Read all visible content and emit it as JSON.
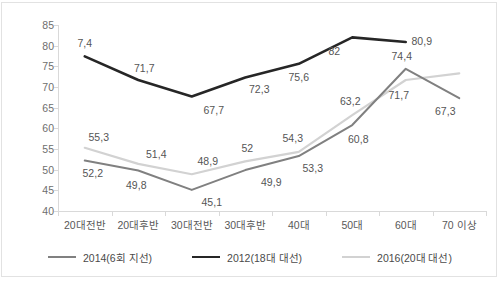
{
  "chart_data": {
    "type": "line",
    "title": "",
    "subtitle": "",
    "xlabel": "",
    "ylabel": "",
    "categories": [
      "20대전반",
      "20대후반",
      "30대전반",
      "30대후반",
      "40대",
      "50대",
      "60대",
      "70 이상"
    ],
    "ylim": [
      40,
      85
    ],
    "ytick_step": 5,
    "yticks": [
      "85",
      "80",
      "75",
      "70",
      "65",
      "60",
      "55",
      "50",
      "45",
      "40"
    ],
    "grid": false,
    "legend_position": "bottom",
    "series": [
      {
        "name": "2014(6회 지선)",
        "color": "#808080",
        "width": 2,
        "values": [
          52.2,
          49.8,
          45.1,
          49.9,
          53.3,
          60.8,
          74.4,
          67.3
        ],
        "labels": [
          "52,2",
          "49,8",
          "45,1",
          "49,9",
          "53,3",
          "60,8",
          "74,4",
          "67,3"
        ]
      },
      {
        "name": "2012(18대 대선)",
        "color": "#262626",
        "width": 2.6,
        "values": [
          77.4,
          71.7,
          67.7,
          72.3,
          75.6,
          82.0,
          80.9,
          null
        ],
        "labels": [
          "7,4",
          "71,7",
          "67,7",
          "72,3",
          "75,6",
          "82",
          "80,9",
          ""
        ]
      },
      {
        "name": "2016(20대 대선)",
        "color": "#d2d2d2",
        "width": 2.2,
        "values": [
          55.3,
          51.4,
          48.9,
          52.0,
          54.3,
          63.2,
          71.7,
          73.3
        ],
        "labels": [
          "55,3",
          "51,4",
          "48,9",
          "52",
          "54,3",
          "63,2",
          "71,7",
          "73,3"
        ]
      }
    ],
    "data_label_positions": [
      {
        "series": 1,
        "index": 0,
        "text": "7,4",
        "dx": 0,
        "dy": -13
      },
      {
        "series": 1,
        "index": 1,
        "text": "71,7",
        "dx": 6,
        "dy": -12
      },
      {
        "series": 1,
        "index": 2,
        "text": "67,7",
        "dx": 22,
        "dy": 13
      },
      {
        "series": 1,
        "index": 3,
        "text": "72,3",
        "dx": 14,
        "dy": 12
      },
      {
        "series": 1,
        "index": 4,
        "text": "75,6",
        "dx": 0,
        "dy": 13
      },
      {
        "series": 1,
        "index": 5,
        "text": "82",
        "dx": -18,
        "dy": 14
      },
      {
        "series": 1,
        "index": 6,
        "text": "80,9",
        "dx": 16,
        "dy": -1
      },
      {
        "series": 2,
        "index": 0,
        "text": "55,3",
        "dx": 14,
        "dy": -11
      },
      {
        "series": 2,
        "index": 1,
        "text": "51,4",
        "dx": 18,
        "dy": -10
      },
      {
        "series": 2,
        "index": 2,
        "text": "48,9",
        "dx": 16,
        "dy": -13
      },
      {
        "series": 2,
        "index": 3,
        "text": "52",
        "dx": 2,
        "dy": -13
      },
      {
        "series": 2,
        "index": 4,
        "text": "54,3",
        "dx": -6,
        "dy": -14
      },
      {
        "series": 2,
        "index": 5,
        "text": "63,2",
        "dx": -2,
        "dy": -14
      },
      {
        "series": 2,
        "index": 6,
        "text": "71,7",
        "dx": -7,
        "dy": 15
      },
      {
        "series": 0,
        "index": 0,
        "text": "52,2",
        "dx": 8,
        "dy": 12
      },
      {
        "series": 0,
        "index": 1,
        "text": "49,8",
        "dx": -2,
        "dy": 15
      },
      {
        "series": 0,
        "index": 2,
        "text": "45,1",
        "dx": 20,
        "dy": 12
      },
      {
        "series": 0,
        "index": 3,
        "text": "49,9",
        "dx": 26,
        "dy": 12
      },
      {
        "series": 0,
        "index": 4,
        "text": "53,3",
        "dx": 14,
        "dy": 12
      },
      {
        "series": 0,
        "index": 5,
        "text": "60,8",
        "dx": 6,
        "dy": 14
      },
      {
        "series": 0,
        "index": 6,
        "text": "74,4",
        "dx": -4,
        "dy": -13
      },
      {
        "series": 0,
        "index": 7,
        "text": "67,3",
        "dx": -14,
        "dy": 13
      }
    ]
  },
  "legend": {
    "items": [
      {
        "label": "2014(6회 지선)",
        "color": "#808080",
        "width": 2
      },
      {
        "label": "2012(18대 대선)",
        "color": "#262626",
        "width": 2.6
      },
      {
        "label": "2016(20대 대선)",
        "color": "#d2d2d2",
        "width": 2.2
      }
    ]
  }
}
